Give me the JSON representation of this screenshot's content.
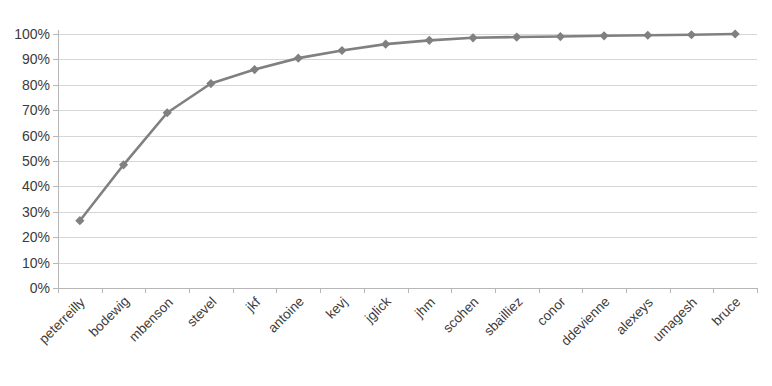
{
  "chart_data": {
    "type": "line",
    "title": "",
    "subtitle": "",
    "xlabel": "",
    "ylabel": "",
    "ylim": [
      0,
      100
    ],
    "grid": true,
    "legend": false,
    "legend_position": "none",
    "series_color": "#808080",
    "marker": "diamond",
    "categories": [
      "peterreilly",
      "bodewig",
      "mbenson",
      "stevel",
      "jkf",
      "antoine",
      "kevj",
      "jglick",
      "jhm",
      "scohen",
      "sbailliez",
      "conor",
      "ddevienne",
      "alexeys",
      "umagesh",
      "bruce"
    ],
    "values": [
      26.5,
      48.5,
      69,
      80.5,
      86,
      90.5,
      93.5,
      96,
      97.5,
      98.5,
      98.8,
      99,
      99.3,
      99.5,
      99.7,
      100
    ],
    "ytick_labels": [
      "100%",
      "90%",
      "80%",
      "70%",
      "60%",
      "50%",
      "40%",
      "30%",
      "20%",
      "10%",
      "0%"
    ],
    "ytick_values": [
      100,
      90,
      80,
      70,
      60,
      50,
      40,
      30,
      20,
      10,
      0
    ],
    "series": [
      {
        "name": "cumulative-percent",
        "values": [
          26.5,
          48.5,
          69,
          80.5,
          86,
          90.5,
          93.5,
          96,
          97.5,
          98.5,
          98.8,
          99,
          99.3,
          99.5,
          99.7,
          100
        ]
      }
    ]
  },
  "colors": {
    "series": "#808080",
    "gridline": "#d6d6d6",
    "axis": "#b7b7b7",
    "text": "#3b3b3b",
    "background": "#ffffff"
  }
}
